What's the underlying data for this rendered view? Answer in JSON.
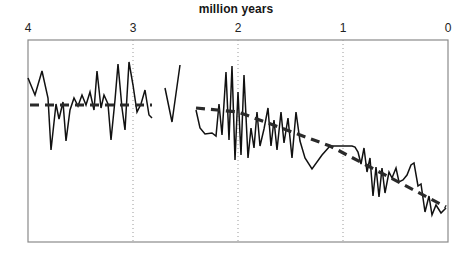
{
  "chart": {
    "title": "million years",
    "axis": {
      "xlabel": "million years",
      "xlim": [
        4,
        0
      ],
      "reversed": true,
      "tick_labels": [
        "4",
        "3",
        "2",
        "1",
        "0"
      ],
      "tick_values": [
        4,
        3,
        2,
        1,
        0
      ],
      "tick_pixels": [
        28,
        133,
        238,
        343,
        448
      ],
      "gridlines": "dotted vertical at 3, 2, 1",
      "ylabel": "",
      "y_ticks": [],
      "frame": {
        "left": 28,
        "top": 40,
        "right": 448,
        "bottom": 242
      }
    },
    "colors": {
      "data_line": "#111111",
      "trend_line": "#2a2a2a",
      "frame": "#8a8a8a",
      "gridline": "#9a9a9a",
      "background": "#ffffff",
      "text": "#161616"
    }
  },
  "chart_data": {
    "type": "line",
    "title": "million years",
    "subtitle": "",
    "xlabel": "million years",
    "ylabel": "",
    "xlim": [
      4,
      0
    ],
    "ylim": [
      0,
      1
    ],
    "grid": "vertical dotted gridlines at x = 3, 2, 1",
    "legend": "none",
    "series": [
      {
        "name": "proxy-series-segment-1",
        "kind": "jagged-line",
        "x_range": [
          4.0,
          2.83
        ],
        "points_px": [
          [
            28,
            78
          ],
          [
            35,
            95
          ],
          [
            42,
            71
          ],
          [
            48,
            98
          ],
          [
            51,
            150
          ],
          [
            56,
            104
          ],
          [
            59,
            119
          ],
          [
            63,
            102
          ],
          [
            66,
            141
          ],
          [
            70,
            110
          ],
          [
            74,
            98
          ],
          [
            78,
            106
          ],
          [
            82,
            95
          ],
          [
            86,
            105
          ],
          [
            90,
            92
          ],
          [
            94,
            110
          ],
          [
            97,
            71
          ],
          [
            101,
            108
          ],
          [
            104,
            95
          ],
          [
            108,
            104
          ],
          [
            111,
            140
          ],
          [
            115,
            100
          ],
          [
            118,
            64
          ],
          [
            122,
            108
          ],
          [
            125,
            130
          ],
          [
            129,
            62
          ],
          [
            133,
            85
          ],
          [
            137,
            112
          ],
          [
            141,
            104
          ],
          [
            145,
            90
          ],
          [
            149,
            115
          ],
          [
            152,
            118
          ]
        ]
      },
      {
        "name": "proxy-series-segment-2-short",
        "kind": "jagged-line",
        "x_range": [
          2.72,
          2.56
        ],
        "points_px": [
          [
            165,
            88
          ],
          [
            172,
            122
          ],
          [
            180,
            65
          ]
        ]
      },
      {
        "name": "proxy-series-segment-3",
        "kind": "jagged-line",
        "x_range": [
          2.45,
          0.0
        ],
        "points_px": [
          [
            196,
            110
          ],
          [
            200,
            128
          ],
          [
            205,
            134
          ],
          [
            212,
            133
          ],
          [
            216,
            136
          ],
          [
            219,
            104
          ],
          [
            222,
            135
          ],
          [
            226,
            72
          ],
          [
            229,
            140
          ],
          [
            232,
            66
          ],
          [
            235,
            160
          ],
          [
            238,
            92
          ],
          [
            241,
            155
          ],
          [
            244,
            75
          ],
          [
            248,
            158
          ],
          [
            251,
            128
          ],
          [
            254,
            148
          ],
          [
            257,
            112
          ],
          [
            260,
            146
          ],
          [
            264,
            129
          ],
          [
            268,
            108
          ],
          [
            271,
            146
          ],
          [
            274,
            120
          ],
          [
            277,
            150
          ],
          [
            281,
            112
          ],
          [
            284,
            143
          ],
          [
            288,
            118
          ],
          [
            292,
            158
          ],
          [
            296,
            112
          ],
          [
            300,
            141
          ],
          [
            305,
            158
          ],
          [
            312,
            169
          ],
          [
            322,
            155
          ],
          [
            330,
            146
          ],
          [
            352,
            146
          ],
          [
            355,
            147
          ],
          [
            358,
            152
          ],
          [
            361,
            164
          ],
          [
            364,
            148
          ],
          [
            367,
            172
          ],
          [
            370,
            158
          ],
          [
            373,
            196
          ],
          [
            376,
            167
          ],
          [
            379,
            197
          ],
          [
            382,
            168
          ],
          [
            385,
            193
          ],
          [
            389,
            172
          ],
          [
            392,
            178
          ],
          [
            396,
            168
          ],
          [
            399,
            182
          ],
          [
            403,
            180
          ],
          [
            407,
            175
          ],
          [
            411,
            165
          ],
          [
            414,
            163
          ],
          [
            418,
            186
          ],
          [
            421,
            184
          ],
          [
            425,
            212
          ],
          [
            429,
            196
          ],
          [
            432,
            215
          ],
          [
            436,
            205
          ],
          [
            441,
            213
          ],
          [
            446,
            208
          ]
        ]
      }
    ],
    "trend_lines": [
      {
        "name": "trend-flat-early",
        "style": "dashed",
        "x_from": 4.0,
        "x_to": 2.83,
        "points_px": [
          [
            30,
            105
          ],
          [
            152,
            105
          ]
        ],
        "description": "flat dashed trend, no slope"
      },
      {
        "name": "trend-declining-late",
        "style": "dashed",
        "x_from": 2.45,
        "x_to": 0.0,
        "points_px": [
          [
            196,
            108
          ],
          [
            238,
            112
          ],
          [
            330,
            146
          ],
          [
            446,
            207
          ]
        ],
        "description": "dashed trend declining toward present"
      }
    ]
  }
}
